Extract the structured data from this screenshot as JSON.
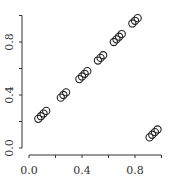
{
  "chart_data": {
    "type": "scatter",
    "title": "",
    "xlabel": "",
    "ylabel": "",
    "xlim": [
      -0.03,
      1.02
    ],
    "ylim": [
      -0.02,
      1.05
    ],
    "x_ticks": [
      0.0,
      0.2,
      0.4,
      0.6,
      0.8,
      1.0
    ],
    "x_tick_labels": [
      "0.0",
      "",
      "0.4",
      "",
      "0.8",
      ""
    ],
    "y_ticks": [
      0.0,
      0.2,
      0.4,
      0.6,
      0.8,
      1.0
    ],
    "y_tick_labels": [
      "0.0",
      "",
      "0.4",
      "",
      "0.8",
      ""
    ],
    "grid": false,
    "legend": null,
    "marker": "open-circle",
    "marker_color": "#222222",
    "series": [
      {
        "name": "points",
        "x": [
          0.07,
          0.09,
          0.11,
          0.13,
          0.24,
          0.26,
          0.28,
          0.38,
          0.4,
          0.42,
          0.44,
          0.52,
          0.54,
          0.56,
          0.64,
          0.66,
          0.68,
          0.7,
          0.78,
          0.8,
          0.82,
          0.91,
          0.93,
          0.95,
          0.97
        ],
        "y": [
          0.22,
          0.24,
          0.26,
          0.28,
          0.38,
          0.4,
          0.42,
          0.52,
          0.54,
          0.56,
          0.58,
          0.66,
          0.68,
          0.7,
          0.8,
          0.82,
          0.84,
          0.86,
          0.94,
          0.96,
          0.98,
          0.08,
          0.1,
          0.12,
          0.14
        ]
      }
    ]
  }
}
